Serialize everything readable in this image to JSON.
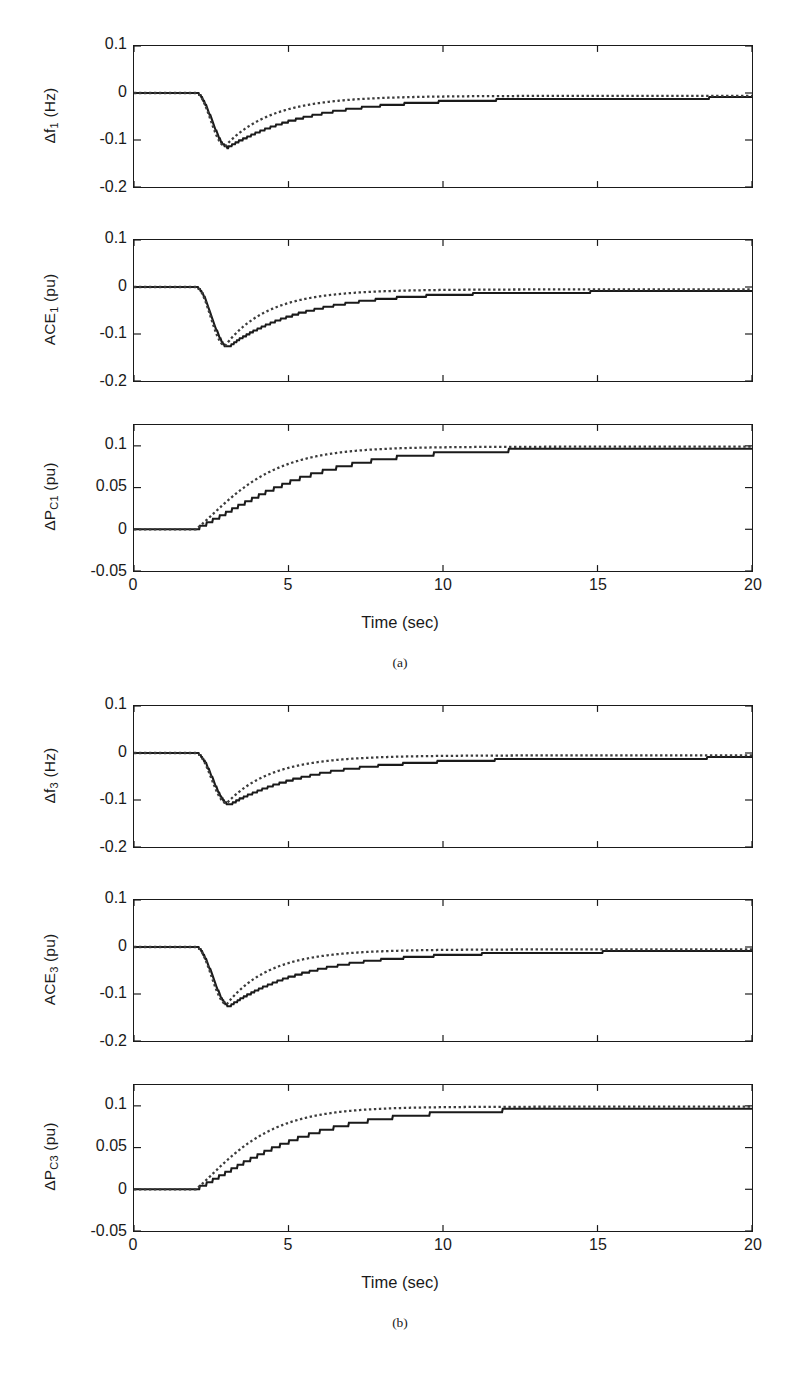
{
  "figure": {
    "width": 800,
    "height": 1382,
    "background": "#ffffff",
    "ink": "#1a1a1a"
  },
  "axes": {
    "x": {
      "label": "Time (sec)",
      "ticks": [
        "0",
        "5",
        "10",
        "15",
        "20"
      ],
      "tick_values": [
        0,
        5,
        10,
        15,
        20
      ],
      "lim": [
        0,
        20
      ]
    },
    "y_freq": {
      "ticks": [
        "0.1",
        "0",
        "-0.1",
        "-0.2"
      ],
      "tick_values": [
        0.1,
        0,
        -0.1,
        -0.2
      ],
      "lim": [
        -0.2,
        0.1
      ]
    },
    "y_power": {
      "ticks": [
        "0.1",
        "0.05",
        "0",
        "-0.05"
      ],
      "tick_values": [
        0.1,
        0.05,
        0,
        -0.05
      ],
      "lim": [
        -0.05,
        0.125
      ]
    }
  },
  "legend": {
    "series": [
      {
        "name": "solid-series",
        "style": "solid",
        "color": "#1a1a1a"
      },
      {
        "name": "dotted-series",
        "style": "dotted",
        "color": "#3c3c3c"
      }
    ]
  },
  "panels": [
    {
      "id": "a",
      "caption": "(a)",
      "xlabel": "Time (sec)",
      "subplots": [
        {
          "id": "df1",
          "ylabel_main": "Δf",
          "ylabel_sub": "1",
          "ylabel_unit": " (Hz)",
          "ylabel_full": "Δf₁ (Hz)",
          "axis": "y_freq"
        },
        {
          "id": "ace1",
          "ylabel_main": "ACE",
          "ylabel_sub": "1",
          "ylabel_unit": " (pu)",
          "ylabel_full": "ACE₁ (pu)",
          "axis": "y_freq"
        },
        {
          "id": "dpc1",
          "ylabel_main": "ΔP",
          "ylabel_sub": "C1",
          "ylabel_unit": " (pu)",
          "ylabel_full": "ΔPC₁ (pu)",
          "axis": "y_power"
        }
      ]
    },
    {
      "id": "b",
      "caption": "(b)",
      "xlabel": "Time (sec)",
      "subplots": [
        {
          "id": "df3",
          "ylabel_main": "Δf",
          "ylabel_sub": "3",
          "ylabel_unit": " (Hz)",
          "ylabel_full": "Δf₃ (Hz)",
          "axis": "y_freq"
        },
        {
          "id": "ace3",
          "ylabel_main": "ACE",
          "ylabel_sub": "3",
          "ylabel_unit": " (pu)",
          "ylabel_full": "ACE₃ (pu)",
          "axis": "y_freq"
        },
        {
          "id": "dpc3",
          "ylabel_main": "ΔP",
          "ylabel_sub": "C3",
          "ylabel_unit": " (pu)",
          "ylabel_full": "ΔPC₃ (pu)",
          "axis": "y_power"
        }
      ]
    }
  ],
  "chart_data": {
    "type": "line",
    "title": "",
    "xlabel": "Time (sec)",
    "xlim": [
      0,
      20
    ],
    "grid": false,
    "legend_position": "none",
    "disturbance_time": 2.0,
    "charts": [
      {
        "id": "df1",
        "panel": "a",
        "ylabel": "Δf₁ (Hz)",
        "ylim": [
          -0.2,
          0.1
        ],
        "yticks": [
          0.1,
          0,
          -0.1,
          -0.2
        ],
        "series": [
          {
            "name": "solid",
            "style": "solid",
            "model": {
              "step": 2.0,
              "nadir_t": 3.05,
              "nadir_y": -0.116,
              "settle_y": -0.01,
              "rise": 0.62,
              "decay": 0.45,
              "tail": 0.3,
              "stair": true
            }
          },
          {
            "name": "dotted",
            "style": "dotted",
            "model": {
              "step": 2.0,
              "nadir_t": 2.95,
              "nadir_y": -0.113,
              "settle_y": -0.006,
              "rise": 0.58,
              "decay": 0.78,
              "tail": 0.52,
              "stair": false
            }
          }
        ]
      },
      {
        "id": "ace1",
        "panel": "a",
        "ylabel": "ACE₁ (pu)",
        "ylim": [
          -0.2,
          0.1
        ],
        "yticks": [
          0.1,
          0,
          -0.1,
          -0.2
        ],
        "series": [
          {
            "name": "solid",
            "style": "solid",
            "model": {
              "step": 2.0,
              "nadir_t": 3.05,
              "nadir_y": -0.128,
              "settle_y": -0.009,
              "rise": 0.6,
              "decay": 0.48,
              "tail": 0.32,
              "stair": true
            }
          },
          {
            "name": "dotted",
            "style": "dotted",
            "model": {
              "step": 2.0,
              "nadir_t": 2.95,
              "nadir_y": -0.125,
              "settle_y": -0.005,
              "rise": 0.56,
              "decay": 0.85,
              "tail": 0.55,
              "stair": false
            }
          }
        ]
      },
      {
        "id": "dpc1",
        "panel": "a",
        "ylabel": "ΔPC₁ (pu)",
        "ylim": [
          -0.05,
          0.125
        ],
        "yticks": [
          0.1,
          0.05,
          0,
          -0.05
        ],
        "series": [
          {
            "name": "solid",
            "style": "solid",
            "model": {
              "step": 2.0,
              "final_y": 0.097,
              "tau": 2.55,
              "stair": true
            }
          },
          {
            "name": "dotted",
            "style": "dotted",
            "model": {
              "step": 2.0,
              "final_y": 0.099,
              "tau": 1.55,
              "stair": false
            }
          }
        ]
      },
      {
        "id": "df3",
        "panel": "b",
        "ylabel": "Δf₃ (Hz)",
        "ylim": [
          -0.2,
          0.1
        ],
        "yticks": [
          0.1,
          0,
          -0.1,
          -0.2
        ],
        "series": [
          {
            "name": "solid",
            "style": "solid",
            "model": {
              "step": 2.0,
              "nadir_t": 3.1,
              "nadir_y": -0.11,
              "settle_y": -0.01,
              "rise": 0.62,
              "decay": 0.44,
              "tail": 0.3,
              "stair": true
            }
          },
          {
            "name": "dotted",
            "style": "dotted",
            "model": {
              "step": 2.0,
              "nadir_t": 3.0,
              "nadir_y": -0.107,
              "settle_y": -0.005,
              "rise": 0.58,
              "decay": 0.8,
              "tail": 0.55,
              "stair": false
            }
          }
        ]
      },
      {
        "id": "ace3",
        "panel": "b",
        "ylabel": "ACE₃ (pu)",
        "ylim": [
          -0.2,
          0.1
        ],
        "yticks": [
          0.1,
          0,
          -0.1,
          -0.2
        ],
        "series": [
          {
            "name": "solid",
            "style": "solid",
            "model": {
              "step": 2.0,
              "nadir_t": 3.1,
              "nadir_y": -0.126,
              "settle_y": -0.009,
              "rise": 0.6,
              "decay": 0.46,
              "tail": 0.31,
              "stair": true
            }
          },
          {
            "name": "dotted",
            "style": "dotted",
            "model": {
              "step": 2.0,
              "nadir_t": 3.0,
              "nadir_y": -0.122,
              "settle_y": -0.005,
              "rise": 0.56,
              "decay": 0.84,
              "tail": 0.56,
              "stair": false
            }
          }
        ]
      },
      {
        "id": "dpc3",
        "panel": "b",
        "ylabel": "ΔPC₃ (pu)",
        "ylim": [
          -0.05,
          0.125
        ],
        "yticks": [
          0.1,
          0.05,
          0,
          -0.05
        ],
        "series": [
          {
            "name": "solid",
            "style": "solid",
            "model": {
              "step": 2.0,
              "final_y": 0.097,
              "tau": 2.5,
              "stair": true
            }
          },
          {
            "name": "dotted",
            "style": "dotted",
            "model": {
              "step": 2.0,
              "final_y": 0.099,
              "tau": 1.5,
              "stair": false
            }
          }
        ]
      }
    ]
  },
  "geometry": {
    "plot_left": 133,
    "plot_right": 753,
    "panels": [
      {
        "id": "a",
        "subplot_tops": [
          45,
          239,
          424
        ],
        "subplot_heights": [
          143,
          143,
          148
        ],
        "xlab_y": 613,
        "caption_y": 655
      },
      {
        "id": "b",
        "subplot_tops": [
          705,
          899,
          1084
        ],
        "subplot_heights": [
          143,
          143,
          148
        ],
        "xlab_y": 1273,
        "caption_y": 1315
      }
    ]
  }
}
